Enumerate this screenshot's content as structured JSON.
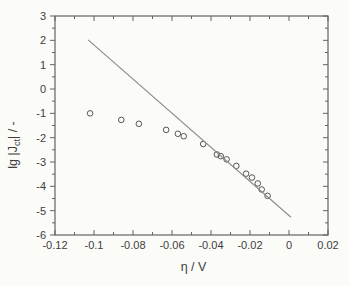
{
  "chart_data": {
    "type": "scatter",
    "title": "",
    "xlabel": "η / V",
    "ylabel": "lg |J_ct| / -",
    "ylabel_parts": {
      "prefix": "lg |J",
      "sub": "ct",
      "suffix": "| / -"
    },
    "xlim": [
      -0.12,
      0.02
    ],
    "ylim": [
      -6,
      3
    ],
    "grid": false,
    "legend": "none",
    "x_major_ticks": [
      -0.12,
      -0.1,
      -0.08,
      -0.06,
      -0.04,
      -0.02,
      0,
      0.02
    ],
    "x_tick_labels": [
      "-0.12",
      "-0.1",
      "-0.08",
      "-0.06",
      "-0.04",
      "-0.02",
      "0",
      "0.02"
    ],
    "y_major_ticks": [
      3,
      2,
      1,
      0,
      -1,
      -2,
      -3,
      -4,
      -5,
      -6
    ],
    "y_tick_labels": [
      "3",
      "2",
      "1",
      "0",
      "-1",
      "-2",
      "-3",
      "-4",
      "-5",
      "-6"
    ],
    "x_minor_step": 0.01,
    "y_minor_step": 0.5,
    "series": [
      {
        "name": "measured-points",
        "type": "scatter",
        "marker": "open-circle",
        "points": [
          [
            -0.102,
            -1.0
          ],
          [
            -0.086,
            -1.27
          ],
          [
            -0.077,
            -1.43
          ],
          [
            -0.063,
            -1.68
          ],
          [
            -0.057,
            -1.84
          ],
          [
            -0.054,
            -1.94
          ],
          [
            -0.044,
            -2.26
          ],
          [
            -0.037,
            -2.69
          ],
          [
            -0.035,
            -2.76
          ],
          [
            -0.032,
            -2.89
          ],
          [
            -0.027,
            -3.16
          ],
          [
            -0.022,
            -3.48
          ],
          [
            -0.019,
            -3.64
          ],
          [
            -0.016,
            -3.88
          ],
          [
            -0.014,
            -4.13
          ],
          [
            -0.011,
            -4.39
          ]
        ]
      },
      {
        "name": "tafel-fit-line",
        "type": "line",
        "points": [
          [
            -0.103,
            2.02
          ],
          [
            0.001,
            -5.27
          ]
        ]
      }
    ],
    "colors": {
      "background": "#fbfbf8",
      "frame": "#636363",
      "text": "#3d3d3d",
      "line": "#8a8a8a",
      "marker": "#555555"
    }
  }
}
